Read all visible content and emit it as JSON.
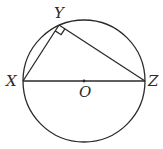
{
  "diagram": {
    "type": "geometry",
    "circle": {
      "cx": 84,
      "cy": 81,
      "r": 61,
      "center_label": "O"
    },
    "points": {
      "X": {
        "x": 23,
        "y": 81,
        "label": "X"
      },
      "Y": {
        "x": 59,
        "y": 25,
        "label": "Y"
      },
      "Z": {
        "x": 145,
        "y": 81,
        "label": "Z"
      },
      "O": {
        "x": 84,
        "y": 81,
        "label": "O"
      }
    },
    "segments": [
      [
        "X",
        "Y"
      ],
      [
        "Y",
        "Z"
      ],
      [
        "X",
        "Z"
      ]
    ],
    "right_angle_at": "Y",
    "colors": {
      "stroke": "#2a2a2a",
      "background": "#ffffff"
    }
  }
}
